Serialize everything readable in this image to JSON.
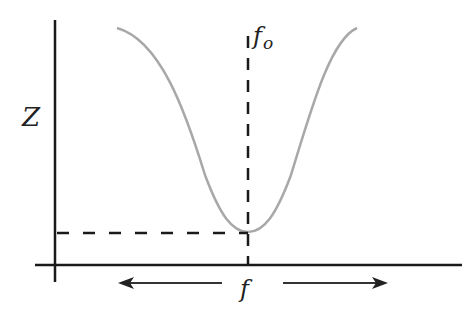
{
  "labels": {
    "y_axis": "Z",
    "resonance_base": "f",
    "resonance_sub": "o",
    "x_axis": "f"
  },
  "colors": {
    "axis": "#1a1a1a",
    "curve": "#a8a8a8",
    "dashed": "#1a1a1a"
  },
  "geometry": {
    "y_axis_x": 55,
    "x_axis_y": 265,
    "resonance_x": 248,
    "min_impedance_y": 232
  }
}
